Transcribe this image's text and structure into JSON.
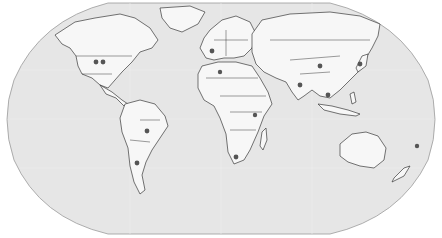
{
  "map": {
    "projection": "Robinson",
    "ocean_color": "#e6e6e6",
    "land_color": "#f7f7f7",
    "border_color": "#3a3a3a",
    "marker_color": "#555555",
    "markers": [
      {
        "region": "United States West",
        "x": 96,
        "y": 62
      },
      {
        "region": "United States Central",
        "x": 103,
        "y": 62
      },
      {
        "region": "France",
        "x": 212,
        "y": 51
      },
      {
        "region": "North Africa",
        "x": 220,
        "y": 72
      },
      {
        "region": "China",
        "x": 320,
        "y": 66
      },
      {
        "region": "Japan",
        "x": 360,
        "y": 64
      },
      {
        "region": "India",
        "x": 300,
        "y": 85
      },
      {
        "region": "Southeast Asia",
        "x": 328,
        "y": 95
      },
      {
        "region": "East Africa",
        "x": 255,
        "y": 115
      },
      {
        "region": "Brazil",
        "x": 147,
        "y": 131
      },
      {
        "region": "Argentina",
        "x": 137,
        "y": 163
      },
      {
        "region": "South Africa",
        "x": 236,
        "y": 157
      },
      {
        "region": "South Pacific",
        "x": 417,
        "y": 146
      }
    ]
  }
}
